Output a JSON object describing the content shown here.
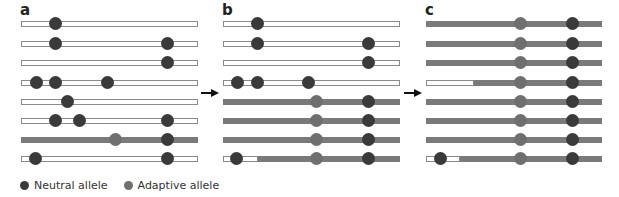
{
  "colors": {
    "neutral": "#3a3a3a",
    "adaptive": "#6f6f6f",
    "grey_bar": "#7a7a7a",
    "white_bar_border": "#8a8a8a"
  },
  "panels": [
    {
      "label": "a",
      "x0": 21,
      "x1": 198,
      "rows": [
        {
          "y": 24,
          "grey_from": null,
          "dots": [
            {
              "x": 55,
              "type": "neutral"
            }
          ]
        },
        {
          "y": 44,
          "grey_from": null,
          "dots": [
            {
              "x": 55,
              "type": "neutral"
            },
            {
              "x": 167,
              "type": "neutral"
            }
          ]
        },
        {
          "y": 63,
          "grey_from": null,
          "dots": [
            {
              "x": 167,
              "type": "neutral"
            }
          ]
        },
        {
          "y": 83,
          "grey_from": null,
          "dots": [
            {
              "x": 36,
              "type": "neutral"
            },
            {
              "x": 55,
              "type": "neutral"
            },
            {
              "x": 107,
              "type": "neutral"
            }
          ]
        },
        {
          "y": 102,
          "grey_from": null,
          "dots": [
            {
              "x": 67,
              "type": "neutral"
            }
          ]
        },
        {
          "y": 121,
          "grey_from": null,
          "dots": [
            {
              "x": 55,
              "type": "neutral"
            },
            {
              "x": 79,
              "type": "neutral"
            },
            {
              "x": 167,
              "type": "neutral"
            }
          ]
        },
        {
          "y": 140,
          "grey_from": 21,
          "dots": [
            {
              "x": 115,
              "type": "adaptive"
            },
            {
              "x": 167,
              "type": "neutral"
            }
          ]
        },
        {
          "y": 159,
          "grey_from": null,
          "dots": [
            {
              "x": 35,
              "type": "neutral"
            },
            {
              "x": 167,
              "type": "neutral"
            }
          ]
        }
      ]
    },
    {
      "label": "b",
      "x0": 223,
      "x1": 400,
      "rows": [
        {
          "y": 24,
          "grey_from": null,
          "dots": [
            {
              "x": 257,
              "type": "neutral"
            }
          ]
        },
        {
          "y": 44,
          "grey_from": null,
          "dots": [
            {
              "x": 257,
              "type": "neutral"
            },
            {
              "x": 368,
              "type": "neutral"
            }
          ]
        },
        {
          "y": 63,
          "grey_from": null,
          "dots": [
            {
              "x": 368,
              "type": "neutral"
            }
          ]
        },
        {
          "y": 83,
          "grey_from": null,
          "dots": [
            {
              "x": 237,
              "type": "neutral"
            },
            {
              "x": 257,
              "type": "neutral"
            },
            {
              "x": 308,
              "type": "neutral"
            }
          ]
        },
        {
          "y": 102,
          "grey_from": 223,
          "dots": [
            {
              "x": 316,
              "type": "adaptive"
            },
            {
              "x": 368,
              "type": "neutral"
            }
          ]
        },
        {
          "y": 121,
          "grey_from": 223,
          "dots": [
            {
              "x": 316,
              "type": "adaptive"
            },
            {
              "x": 368,
              "type": "neutral"
            }
          ]
        },
        {
          "y": 140,
          "grey_from": 223,
          "dots": [
            {
              "x": 316,
              "type": "adaptive"
            },
            {
              "x": 368,
              "type": "neutral"
            }
          ]
        },
        {
          "y": 159,
          "grey_from": 258,
          "dots": [
            {
              "x": 236,
              "type": "neutral"
            },
            {
              "x": 316,
              "type": "adaptive"
            },
            {
              "x": 368,
              "type": "neutral"
            }
          ]
        }
      ]
    },
    {
      "label": "c",
      "x0": 426,
      "x1": 602,
      "rows": [
        {
          "y": 24,
          "grey_from": 426,
          "dots": [
            {
              "x": 520,
              "type": "adaptive"
            },
            {
              "x": 572,
              "type": "neutral"
            }
          ]
        },
        {
          "y": 44,
          "grey_from": 426,
          "dots": [
            {
              "x": 520,
              "type": "adaptive"
            },
            {
              "x": 572,
              "type": "neutral"
            }
          ]
        },
        {
          "y": 63,
          "grey_from": 426,
          "dots": [
            {
              "x": 520,
              "type": "adaptive"
            },
            {
              "x": 572,
              "type": "neutral"
            }
          ]
        },
        {
          "y": 83,
          "grey_from": 474,
          "dots": [
            {
              "x": 520,
              "type": "adaptive"
            },
            {
              "x": 572,
              "type": "neutral"
            }
          ]
        },
        {
          "y": 102,
          "grey_from": 426,
          "dots": [
            {
              "x": 520,
              "type": "adaptive"
            },
            {
              "x": 572,
              "type": "neutral"
            }
          ]
        },
        {
          "y": 121,
          "grey_from": 426,
          "dots": [
            {
              "x": 520,
              "type": "adaptive"
            },
            {
              "x": 572,
              "type": "neutral"
            }
          ]
        },
        {
          "y": 140,
          "grey_from": 426,
          "dots": [
            {
              "x": 520,
              "type": "adaptive"
            },
            {
              "x": 572,
              "type": "neutral"
            }
          ]
        },
        {
          "y": 159,
          "grey_from": 460,
          "dots": [
            {
              "x": 440,
              "type": "neutral"
            },
            {
              "x": 520,
              "type": "adaptive"
            },
            {
              "x": 572,
              "type": "neutral"
            }
          ]
        }
      ]
    }
  ],
  "arrows": [
    {
      "x": 201,
      "y": 88
    },
    {
      "x": 404,
      "y": 88
    }
  ],
  "legend": {
    "items": [
      {
        "label": "Neutral allele",
        "type": "neutral"
      },
      {
        "label": "Adaptive allele",
        "type": "adaptive"
      }
    ]
  }
}
